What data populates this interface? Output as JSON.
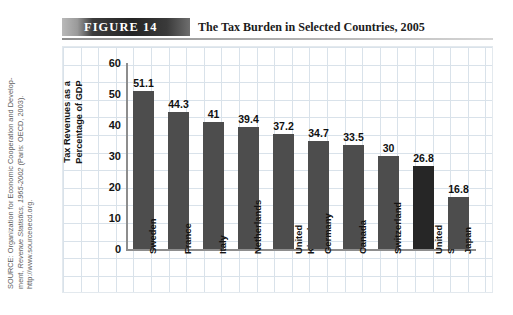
{
  "figure": {
    "tag": "FIGURE  14",
    "title": "The Tax Burden in Selected Countries, 2005"
  },
  "source": {
    "line1": "SOURCE: Organization for Economic Cooperation and Develop-",
    "line2_prefix": "ment, ",
    "line2_italic": "Revenue Statistics, 1965-2002",
    "line2_suffix": " (Paris: OECD, 2003).",
    "line3": "http://www.sourceoecd.org."
  },
  "chart_data": {
    "type": "bar",
    "title": "The Tax Burden in Selected Countries, 2005",
    "xlabel": "",
    "ylabel": "Tax Revenues as a Percentage of GDP",
    "ylabel_line1": "Tax Revenues as a",
    "ylabel_line2": "Percentage of GDP",
    "ylim": [
      0,
      60
    ],
    "yticks": [
      0,
      10,
      20,
      30,
      40,
      50,
      60
    ],
    "ytick_labels": [
      "0",
      "10",
      "20",
      "30",
      "40",
      "50",
      "60"
    ],
    "grid": true,
    "legend": "none",
    "categories": [
      "Sweden",
      "France",
      "Italy",
      "Netherlands",
      "United Kingdom",
      "Germany",
      "Canada",
      "Switzerland",
      "United States",
      "Japan"
    ],
    "category_lines": [
      [
        "Sweden"
      ],
      [
        "France"
      ],
      [
        "Italy"
      ],
      [
        "Netherlands"
      ],
      [
        "United",
        "Kingdom"
      ],
      [
        "Germany"
      ],
      [
        "Canada"
      ],
      [
        "Switzerland"
      ],
      [
        "United",
        "States"
      ],
      [
        "Japan"
      ]
    ],
    "values": [
      51.1,
      44.3,
      41,
      39.4,
      37.2,
      34.7,
      33.5,
      30,
      26.8,
      16.8
    ],
    "value_labels": [
      "51.1",
      "44.3",
      "41",
      "39.4",
      "37.2",
      "34.7",
      "33.5",
      "30",
      "26.8",
      "16.8"
    ],
    "highlight_index": 8,
    "bar_color": "#4d4d4d",
    "highlight_color": "#262626",
    "grid_color": "#d9e2ea",
    "axis_color": "#8d8d8d"
  }
}
